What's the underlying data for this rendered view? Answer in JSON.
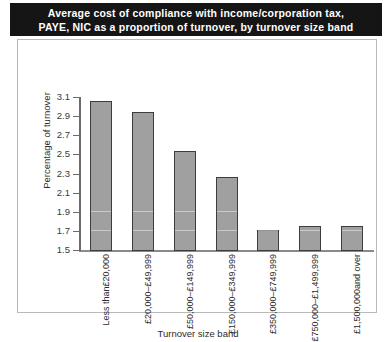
{
  "title": {
    "line1": "Average cost of compliance with income/corporation tax,",
    "line2": "PAYE, NIC as a proportion of turnover, by turnover size band"
  },
  "colors": {
    "title_background": "#151515",
    "title_text": "#ffffff",
    "bar_fill": "#a0a0a0",
    "bar_border": "#3d3d3d",
    "axis": "#6b6b6b",
    "frame_border": "#b9b9b9",
    "page_background": "#ffffff"
  },
  "chart_data": {
    "type": "bar",
    "title": "Average cost of compliance with income/corporation tax, PAYE, NIC as a proportion of turnover, by turnover size band",
    "xlabel": "Turnover size band",
    "ylabel": "Percentage of turnover",
    "ylim": [
      1.5,
      3.1
    ],
    "yticks": [
      1.5,
      1.7,
      1.9,
      2.1,
      2.3,
      2.5,
      2.7,
      2.9,
      3.1
    ],
    "ytick_labels": [
      "1.5",
      "1.7",
      "1.9",
      "2.1",
      "2.3",
      "2.5",
      "2.7",
      "2.9",
      "3.1"
    ],
    "grid": false,
    "legend": null,
    "categories": [
      "Less than £20,000",
      "£20,000 – £49,999",
      "£50,000 – £149,999",
      "£150,000 – £349,999",
      "£350,000 – £749,999",
      "£750,000 – £1,499,999",
      "£1,500,000 and over"
    ],
    "category_lines": [
      [
        "Less than",
        "£20,000"
      ],
      [
        "£20,000",
        "–",
        "£49,999"
      ],
      [
        "£50,000",
        "–",
        "£149,999"
      ],
      [
        "£150,000",
        "–",
        "£349,999"
      ],
      [
        "£350,000",
        "–",
        "£749,999"
      ],
      [
        "£750,000",
        "–",
        "£1,499,999"
      ],
      [
        "£1,500,000",
        "and over"
      ]
    ],
    "values": [
      3.07,
      2.95,
      2.55,
      2.27,
      1.72,
      1.76,
      1.76
    ]
  }
}
